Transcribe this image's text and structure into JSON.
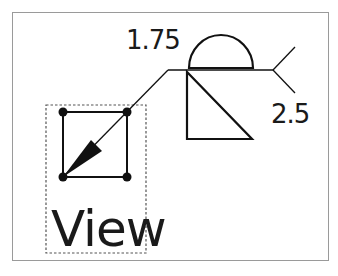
{
  "diagram": {
    "type": "weld-symbol",
    "dimensions": {
      "top_value": "1.75",
      "bottom_value": "2.5"
    },
    "view_label": "View",
    "colors": {
      "stroke": "#111111",
      "frame": "#9a9a9a",
      "dashed_box": "#555555",
      "background": "#ffffff"
    },
    "symbols": [
      {
        "name": "melt-through semicircle",
        "side": "other-side"
      },
      {
        "name": "fillet triangle",
        "side": "arrow-side"
      },
      {
        "name": "tail",
        "side": "end"
      }
    ]
  }
}
